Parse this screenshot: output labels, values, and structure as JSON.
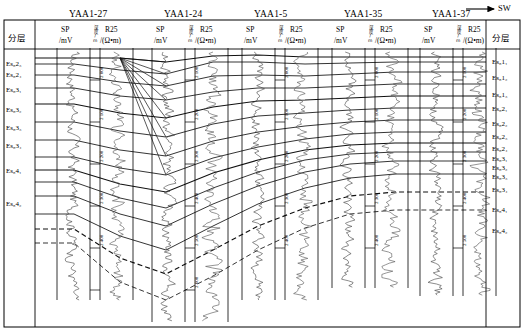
{
  "figure": {
    "type": "well-log-correlation-section",
    "direction_label": "SW",
    "direction_icon": "arrow-right-icon"
  },
  "axis_header": {
    "left_column_title": "分层",
    "right_column_title": "分层",
    "track_labels": {
      "sp": "SP",
      "sp_unit": "/mV",
      "depth_vertical": "深度/m",
      "r25": "R25",
      "r25_unit": "/(Ω•m)"
    }
  },
  "wells": [
    {
      "name": "YAA1-27",
      "x": 95,
      "depth_ticks": [
        "2 000",
        "2 100",
        "2 200",
        "2 300",
        "2 400",
        "2 500"
      ]
    },
    {
      "name": "YAA1-24",
      "x": 190,
      "depth_ticks": [
        "2 100",
        "2 200",
        "2 300",
        "2 400",
        "2 500",
        "2 600"
      ]
    },
    {
      "name": "YAA1-5",
      "x": 280,
      "depth_ticks": [
        "2 000",
        "2 100",
        "2 200",
        "2 300",
        "2 400"
      ]
    },
    {
      "name": "YAA1-35",
      "x": 370,
      "depth_ticks": [
        "2 000",
        "2 100",
        "2 200",
        "2 300",
        "2 400"
      ]
    },
    {
      "name": "YAA1-37",
      "x": 458,
      "depth_ticks": [
        "2 100",
        "2 200",
        "2 300",
        "2 400",
        "2 500"
      ]
    }
  ],
  "left_zones": [
    {
      "label": "Es₈2₃",
      "y": 65
    },
    {
      "label": "Es₈2₄",
      "y": 76
    },
    {
      "label": "Es₈3₁",
      "y": 91
    },
    {
      "label": "Es₈3₂",
      "y": 111
    },
    {
      "label": "Es₈3₃",
      "y": 129
    },
    {
      "label": "Es₈3₄",
      "y": 147
    },
    {
      "label": "Es₈4₁",
      "y": 172
    },
    {
      "label": "Es₈4₂",
      "y": 205
    }
  ],
  "right_zones": [
    {
      "label": "Es₈1₁",
      "y": 63
    },
    {
      "label": "Es₈1₂",
      "y": 79
    },
    {
      "label": "Es₈1₃",
      "y": 96
    },
    {
      "label": "Es₈2₁",
      "y": 110
    },
    {
      "label": "Es₈2₂",
      "y": 125
    },
    {
      "label": "Es₈2₃",
      "y": 138
    },
    {
      "label": "Es₈2₄",
      "y": 150
    },
    {
      "label": "Es₈3₁",
      "y": 160
    },
    {
      "label": "Es₈3₂",
      "y": 169
    },
    {
      "label": "Es₈3₃",
      "y": 178
    },
    {
      "label": "Es₈3₄",
      "y": 191
    },
    {
      "label": "Es₈4₁",
      "y": 211
    },
    {
      "label": "Es₈4₂",
      "y": 232
    }
  ],
  "chart_data": {
    "type": "line",
    "title": "",
    "correlation_lines": [
      {
        "name": "top-datum",
        "style": "solid",
        "points": [
          [
            35,
            58
          ],
          [
            74,
            58
          ],
          [
            120,
            58
          ],
          [
            166,
            62
          ],
          [
            213,
            56
          ],
          [
            258,
            55
          ],
          [
            305,
            57
          ],
          [
            350,
            57
          ],
          [
            395,
            57
          ],
          [
            440,
            57
          ],
          [
            486,
            57
          ]
        ]
      },
      {
        "name": "Es8-1-1",
        "style": "solid",
        "points": [
          [
            35,
            64
          ],
          [
            74,
            64
          ],
          [
            120,
            70
          ],
          [
            166,
            74
          ],
          [
            213,
            62
          ],
          [
            258,
            62
          ],
          [
            305,
            64
          ],
          [
            350,
            63
          ],
          [
            395,
            62
          ],
          [
            440,
            62
          ],
          [
            486,
            62
          ]
        ]
      },
      {
        "name": "Es8-1-2",
        "style": "solid",
        "points": [
          [
            35,
            75
          ],
          [
            74,
            75
          ],
          [
            120,
            82
          ],
          [
            166,
            86
          ],
          [
            213,
            76
          ],
          [
            258,
            75
          ],
          [
            305,
            76
          ],
          [
            350,
            74
          ],
          [
            395,
            72
          ],
          [
            440,
            72
          ],
          [
            486,
            72
          ]
        ]
      },
      {
        "name": "Es8-1-3",
        "style": "solid",
        "points": [
          [
            35,
            88
          ],
          [
            74,
            88
          ],
          [
            120,
            96
          ],
          [
            166,
            100
          ],
          [
            213,
            92
          ],
          [
            258,
            88
          ],
          [
            305,
            88
          ],
          [
            350,
            86
          ],
          [
            395,
            84
          ],
          [
            440,
            84
          ],
          [
            486,
            84
          ]
        ]
      },
      {
        "name": "Es8-2-1",
        "style": "solid",
        "points": [
          [
            35,
            104
          ],
          [
            74,
            104
          ],
          [
            120,
            113
          ],
          [
            166,
            118
          ],
          [
            213,
            107
          ],
          [
            258,
            101
          ],
          [
            305,
            100
          ],
          [
            350,
            98
          ],
          [
            395,
            96
          ],
          [
            440,
            96
          ],
          [
            486,
            96
          ]
        ]
      },
      {
        "name": "Es8-2-2",
        "style": "solid",
        "points": [
          [
            35,
            122
          ],
          [
            74,
            122
          ],
          [
            120,
            131
          ],
          [
            166,
            137
          ],
          [
            213,
            124
          ],
          [
            258,
            116
          ],
          [
            305,
            113
          ],
          [
            350,
            110
          ],
          [
            395,
            108
          ],
          [
            440,
            108
          ],
          [
            486,
            108
          ]
        ]
      },
      {
        "name": "Es8-2-3",
        "style": "solid",
        "points": [
          [
            35,
            140
          ],
          [
            74,
            140
          ],
          [
            120,
            150
          ],
          [
            166,
            156
          ],
          [
            213,
            141
          ],
          [
            258,
            132
          ],
          [
            305,
            126
          ],
          [
            350,
            122
          ],
          [
            395,
            120
          ],
          [
            440,
            120
          ],
          [
            486,
            120
          ]
        ]
      },
      {
        "name": "Es8-2-4",
        "style": "solid",
        "points": [
          [
            35,
            157
          ],
          [
            74,
            157
          ],
          [
            120,
            168
          ],
          [
            166,
            175
          ],
          [
            213,
            158
          ],
          [
            258,
            147
          ],
          [
            305,
            139
          ],
          [
            350,
            134
          ],
          [
            395,
            132
          ],
          [
            440,
            132
          ],
          [
            486,
            132
          ]
        ]
      },
      {
        "name": "Es8-3-1",
        "style": "solid",
        "points": [
          [
            35,
            170
          ],
          [
            74,
            170
          ],
          [
            120,
            184
          ],
          [
            166,
            192
          ],
          [
            213,
            173
          ],
          [
            258,
            160
          ],
          [
            305,
            150
          ],
          [
            350,
            145
          ],
          [
            395,
            143
          ],
          [
            440,
            143
          ],
          [
            486,
            143
          ]
        ]
      },
      {
        "name": "Es8-3-2",
        "style": "solid",
        "points": [
          [
            35,
            182
          ],
          [
            74,
            182
          ],
          [
            120,
            198
          ],
          [
            166,
            208
          ],
          [
            213,
            188
          ],
          [
            258,
            172
          ],
          [
            305,
            160
          ],
          [
            350,
            154
          ],
          [
            395,
            152
          ],
          [
            440,
            152
          ],
          [
            486,
            152
          ]
        ]
      },
      {
        "name": "Es8-3-3",
        "style": "solid",
        "points": [
          [
            35,
            196
          ],
          [
            74,
            196
          ],
          [
            120,
            214
          ],
          [
            166,
            226
          ],
          [
            213,
            204
          ],
          [
            258,
            186
          ],
          [
            305,
            172
          ],
          [
            350,
            164
          ],
          [
            395,
            161
          ],
          [
            440,
            161
          ],
          [
            486,
            161
          ]
        ]
      },
      {
        "name": "Es8-3-4",
        "style": "solid",
        "points": [
          [
            35,
            214
          ],
          [
            74,
            214
          ],
          [
            120,
            236
          ],
          [
            166,
            250
          ],
          [
            213,
            226
          ],
          [
            258,
            204
          ],
          [
            305,
            188
          ],
          [
            350,
            178
          ],
          [
            395,
            174
          ],
          [
            440,
            174
          ],
          [
            486,
            174
          ]
        ]
      },
      {
        "name": "Es8-4-1",
        "style": "dashed",
        "points": [
          [
            35,
            229
          ],
          [
            74,
            229
          ],
          [
            120,
            258
          ],
          [
            166,
            274
          ],
          [
            213,
            250
          ],
          [
            258,
            226
          ],
          [
            305,
            208
          ],
          [
            350,
            196
          ],
          [
            395,
            192
          ],
          [
            440,
            192
          ],
          [
            486,
            192
          ]
        ]
      },
      {
        "name": "Es8-4-2",
        "style": "dashed",
        "points": [
          [
            35,
            243
          ],
          [
            74,
            243
          ],
          [
            120,
            282
          ],
          [
            166,
            300
          ],
          [
            213,
            276
          ],
          [
            258,
            250
          ],
          [
            305,
            228
          ],
          [
            350,
            214
          ],
          [
            395,
            210
          ],
          [
            440,
            210
          ],
          [
            486,
            210
          ]
        ]
      }
    ],
    "fan_origin": [
      120,
      58
    ],
    "xlabel": "",
    "ylabel": "Depth (m)",
    "grid": false,
    "legend": []
  }
}
